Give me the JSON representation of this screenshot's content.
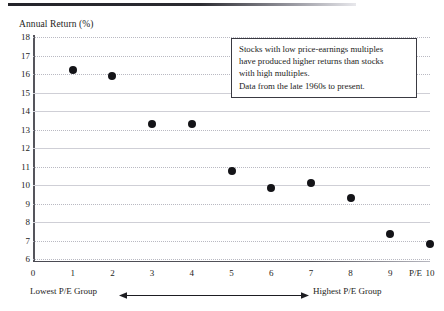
{
  "chart_data": {
    "type": "scatter",
    "title": "",
    "ylabel": "Annual Return (%)",
    "xlabel": "P/E",
    "x": [
      1,
      2,
      3,
      4,
      5,
      6,
      7,
      8,
      9,
      10
    ],
    "values": [
      16.2,
      15.9,
      13.3,
      13.3,
      10.75,
      9.85,
      10.1,
      9.3,
      7.35,
      6.8
    ],
    "xlim": [
      0,
      10
    ],
    "ylim": [
      6,
      18
    ],
    "x_ticks": [
      "0",
      "1",
      "2",
      "3",
      "4",
      "5",
      "6",
      "7",
      "8",
      "9",
      "10"
    ],
    "y_ticks": [
      "18",
      "17",
      "16",
      "15",
      "14",
      "13",
      "12",
      "11",
      "10",
      "9",
      "8",
      "7",
      "6"
    ],
    "grid": true,
    "legend": "none",
    "marker": "filled-circle",
    "marker_color": "#141418",
    "annotations": [
      "Stocks with low price-earnings multiples",
      "have produced higher returns than stocks",
      "with high multiples.",
      "Data from the late 1960s to present."
    ],
    "axis_end_labels": {
      "left": "Lowest P/E Group",
      "right": "Highest P/E Group"
    }
  },
  "callout": {
    "lines": [
      "Stocks with low price-earnings multiples",
      "have produced higher returns than stocks",
      "with high multiples.",
      "Data from the late 1960s to present."
    ]
  },
  "axes": {
    "y_title": "Annual Return (%)",
    "x_unit": "P/E"
  },
  "annotation": {
    "low_label": "Lowest P/E Group",
    "high_label": "Highest P/E Group"
  },
  "colors": {
    "marker": "#141418",
    "axis": "#55555c",
    "grid": "#b9b9c2",
    "text": "#1d1d22",
    "rule": "#24242a"
  }
}
